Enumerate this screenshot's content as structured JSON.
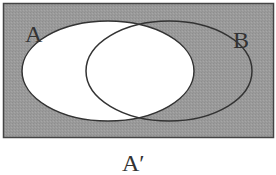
{
  "diagram": {
    "type": "venn",
    "title": "",
    "universe": {
      "shaded": true,
      "fill": "#9a9a9a",
      "stroke": "#444444"
    },
    "sets": [
      {
        "name": "A",
        "label": "A",
        "fill": "#ffffff",
        "stroke": "#333333"
      },
      {
        "name": "B",
        "label": "B",
        "fill": "none",
        "stroke": "#333333"
      }
    ],
    "shaded_region_label": "A′",
    "shaded_region_meaning": "complement of A"
  },
  "colors": {
    "shade": "#9a9a9a",
    "outline": "#333333",
    "background": "#ffffff"
  }
}
